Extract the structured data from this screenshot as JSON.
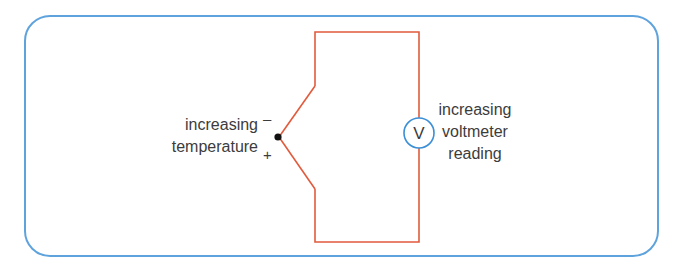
{
  "diagram": {
    "type": "thermocouple-circuit",
    "left_label": [
      "increasing",
      "temperature"
    ],
    "right_label": [
      "increasing",
      "voltmeter",
      "reading"
    ],
    "meter_symbol": "V",
    "junction_signs": {
      "top": "–",
      "bottom": "+"
    },
    "colors": {
      "wire": "#e25a3c",
      "meter": "#3b8fd6",
      "frame": "#5fa3dd",
      "text": "#3c3c3c"
    }
  }
}
